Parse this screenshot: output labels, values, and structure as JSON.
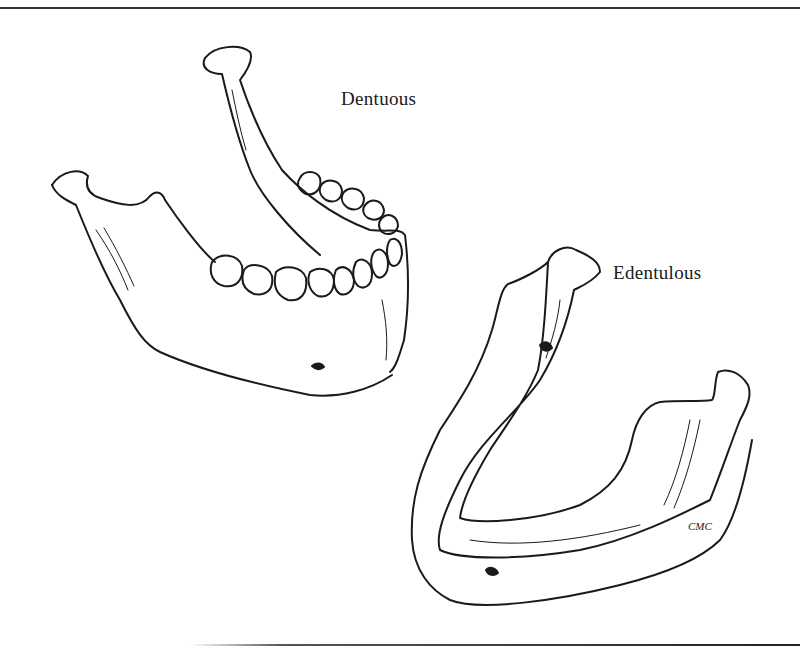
{
  "figure": {
    "labels": {
      "dentulous": "Dentuous",
      "edentulous": "Edentulous"
    },
    "signature": "CMC",
    "subjects": [
      {
        "name": "dentate-mandible",
        "description": "Mandible with full set of teeth"
      },
      {
        "name": "edentulous-mandible",
        "description": "Mandible without teeth, resorbed alveolar ridge"
      }
    ],
    "colors": {
      "ink": "#1a1a1a",
      "paper": "#ffffff"
    }
  }
}
